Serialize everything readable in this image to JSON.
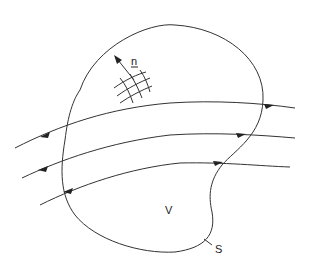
{
  "diagram": {
    "type": "flux-through-closed-surface",
    "labels": {
      "normal": "n",
      "volume": "V",
      "surface": "S"
    },
    "flow_lines": 3,
    "colors": {
      "line": "#333333",
      "background": "#ffffff"
    }
  }
}
